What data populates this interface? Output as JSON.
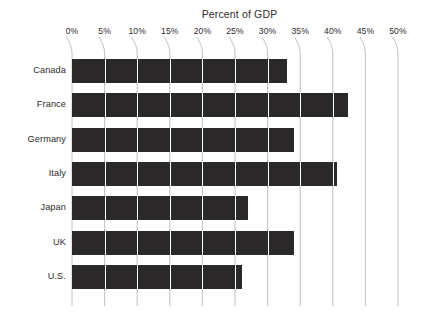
{
  "chart_data": {
    "type": "bar",
    "orientation": "horizontal",
    "title": "Percent of GDP",
    "xlabel": "",
    "ylabel": "",
    "categories": [
      "Canada",
      "France",
      "Germany",
      "Italy",
      "Japan",
      "UK",
      "U.S."
    ],
    "values": [
      33,
      42.3,
      34,
      40.6,
      27,
      34,
      26
    ],
    "xlim": [
      0,
      50
    ],
    "xticks": [
      0,
      5,
      10,
      15,
      20,
      25,
      30,
      35,
      40,
      45,
      50
    ],
    "xticklabels": [
      "0%",
      "5%",
      "10%",
      "15%",
      "20%",
      "25%",
      "30%",
      "35%",
      "40%",
      "45%",
      "50%"
    ],
    "grid": true,
    "grid_orientation": "vertical",
    "legend": null,
    "bar_color": "#2b2829",
    "background_color": "#ffffff",
    "gridline_color": "#b9b9b9",
    "text_color": "#2f2b2c"
  }
}
